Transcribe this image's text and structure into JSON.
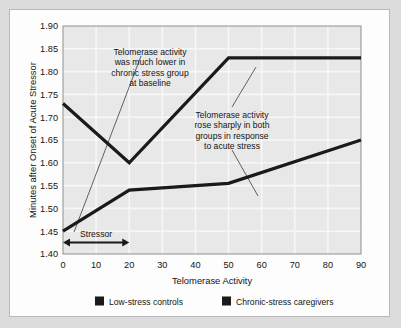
{
  "chart_data": {
    "type": "line",
    "title": "",
    "xlabel": "Telomerase Activity",
    "ylabel": "Minutes after Onset of Acute Stressor",
    "xlim": [
      0,
      90
    ],
    "ylim": [
      1.4,
      1.9
    ],
    "xticks": [
      0,
      10,
      20,
      30,
      40,
      50,
      60,
      70,
      80,
      90
    ],
    "yticks": [
      "1.40",
      "1.45",
      "1.50",
      "1.55",
      "1.60",
      "1.65",
      "1.70",
      "1.75",
      "1.80",
      "1.85",
      "1.90"
    ],
    "grid": true,
    "legend_position": "bottom",
    "series": [
      {
        "name": "Low-stress controls",
        "color": "#1a1a1a",
        "x": [
          0,
          20,
          50,
          90
        ],
        "values": [
          1.73,
          1.6,
          1.83,
          1.83
        ]
      },
      {
        "name": "Chronic-stress caregivers",
        "color": "#1a1a1a",
        "x": [
          0,
          20,
          50,
          90
        ],
        "values": [
          1.45,
          1.54,
          1.555,
          1.65
        ]
      }
    ],
    "annotations": [
      {
        "id": "annotation-baseline",
        "lines": [
          "Telomerase activity",
          "was much lower in",
          "chronic stress group",
          "at baseline"
        ]
      },
      {
        "id": "annotation-acute-stress",
        "lines": [
          "Telomerase activity",
          "rose sharply in both",
          "groups in response",
          "to acute stress"
        ]
      }
    ],
    "span_marker": {
      "label": "Stressor",
      "x_start": 0,
      "x_end": 20,
      "y": 1.425
    }
  },
  "legend": {
    "items": [
      {
        "label": "Low-stress controls",
        "color": "#1a1a1a"
      },
      {
        "label": "Chronic-stress caregivers",
        "color": "#1a1a1a"
      }
    ]
  },
  "colors": {
    "page_background": "#dcdcdc",
    "card_background": "#fdfdfd",
    "card_border": "#b9b9b9",
    "plot_background": "#e8e8e8",
    "gridline": "#f7f7f7",
    "axis": "#8f8f8f",
    "series": "#1a1a1a",
    "text": "#141414",
    "leader_line": "#3c3c3c"
  }
}
